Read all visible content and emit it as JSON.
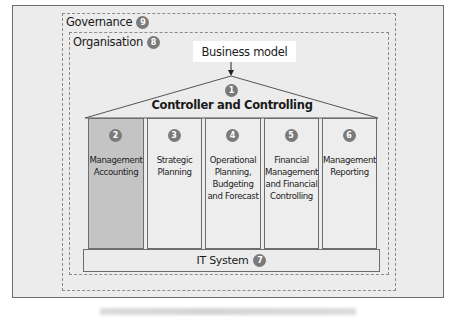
{
  "diagram": {
    "governance": {
      "label": "Governance",
      "badge": "9"
    },
    "organisation": {
      "label": "Organisation",
      "badge": "8"
    },
    "business_model": {
      "label": "Business model"
    },
    "roof": {
      "label": "Controller and Controlling",
      "badge": "1"
    },
    "pillars": [
      {
        "badge": "2",
        "lines": [
          "Management",
          "Accounting"
        ],
        "highlighted": true
      },
      {
        "badge": "3",
        "lines": [
          "Strategic",
          "Planning"
        ],
        "highlighted": false
      },
      {
        "badge": "4",
        "lines": [
          "Operational",
          "Planning,",
          "Budgeting",
          "and Forecast"
        ],
        "highlighted": false
      },
      {
        "badge": "5",
        "lines": [
          "Financial",
          "Management",
          "and Financial",
          "Controlling"
        ],
        "highlighted": false
      },
      {
        "badge": "6",
        "lines": [
          "Management",
          "Reporting"
        ],
        "highlighted": false
      }
    ],
    "foundation": {
      "label": "IT System",
      "badge": "7"
    },
    "colors": {
      "badge": "#7a7a7a",
      "highlight_pillar": "#c4c4c4",
      "background": "#ececec",
      "border": "#6d6d6d"
    }
  }
}
